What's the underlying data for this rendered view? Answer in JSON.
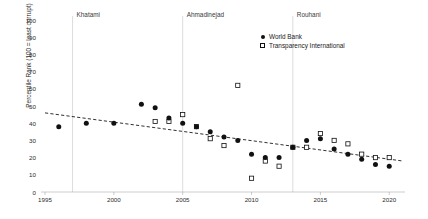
{
  "chart_data": {
    "type": "scatter",
    "title": "",
    "xlabel": "",
    "ylabel": "Percentile Rank (100 = least corrupt)",
    "xlim": [
      1995,
      2021
    ],
    "ylim": [
      0,
      100
    ],
    "xticks": [
      1995,
      2000,
      2005,
      2010,
      2015,
      2020
    ],
    "yticks": [
      0,
      10,
      20,
      30,
      40,
      50,
      60,
      70,
      80,
      90,
      100
    ],
    "grid": false,
    "legend_position": "top-right",
    "series": [
      {
        "name": "World Bank",
        "marker": "filled-circle",
        "color": "#111111",
        "points": [
          [
            1996,
            38
          ],
          [
            1998,
            40
          ],
          [
            2000,
            40
          ],
          [
            2002,
            51
          ],
          [
            2003,
            49
          ],
          [
            2004,
            43
          ],
          [
            2005,
            40
          ],
          [
            2006,
            38
          ],
          [
            2007,
            35
          ],
          [
            2008,
            32
          ],
          [
            2009,
            30
          ],
          [
            2010,
            22
          ],
          [
            2011,
            20
          ],
          [
            2012,
            20
          ],
          [
            2013,
            26
          ],
          [
            2014,
            30
          ],
          [
            2015,
            31
          ],
          [
            2016,
            25
          ],
          [
            2017,
            22
          ],
          [
            2018,
            19
          ],
          [
            2019,
            16
          ],
          [
            2020,
            15
          ]
        ]
      },
      {
        "name": "Transparency International",
        "marker": "open-square",
        "color": "#111111",
        "points": [
          [
            2003,
            41
          ],
          [
            2004,
            41
          ],
          [
            2005,
            45
          ],
          [
            2006,
            38
          ],
          [
            2007,
            31
          ],
          [
            2008,
            27
          ],
          [
            2009,
            62
          ],
          [
            2010,
            8
          ],
          [
            2011,
            18
          ],
          [
            2012,
            15
          ],
          [
            2013,
            26
          ],
          [
            2014,
            26
          ],
          [
            2015,
            34
          ],
          [
            2016,
            30
          ],
          [
            2017,
            28
          ],
          [
            2018,
            22
          ],
          [
            2019,
            20
          ],
          [
            2020,
            20
          ]
        ]
      }
    ],
    "trendline": {
      "type": "dashed-linear",
      "x": [
        1995,
        2021
      ],
      "y": [
        46,
        18
      ]
    },
    "annotations": [
      {
        "label": "Khatami",
        "x": 1997,
        "type": "era-divider"
      },
      {
        "label": "Ahmadinejad",
        "x": 2005,
        "type": "era-divider"
      },
      {
        "label": "Rouhani",
        "x": 2013,
        "type": "era-divider"
      }
    ]
  },
  "legend": {
    "items": [
      {
        "label": "World Bank",
        "marker": "filled-circle"
      },
      {
        "label": "Transparency International",
        "marker": "open-square"
      }
    ]
  }
}
